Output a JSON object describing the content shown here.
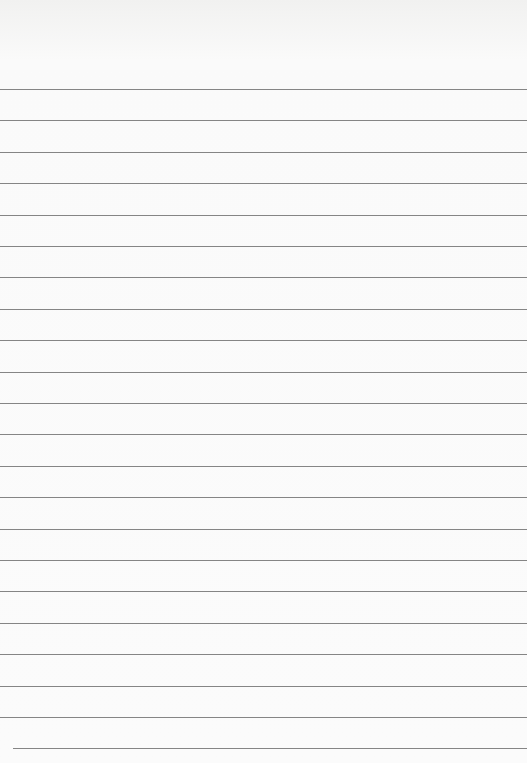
{
  "paper": {
    "type": "lined-paper",
    "line_count": 22,
    "first_line_y": 89,
    "line_spacing": 31.4,
    "line_color": "#707070",
    "background_color": "#fafafa"
  }
}
